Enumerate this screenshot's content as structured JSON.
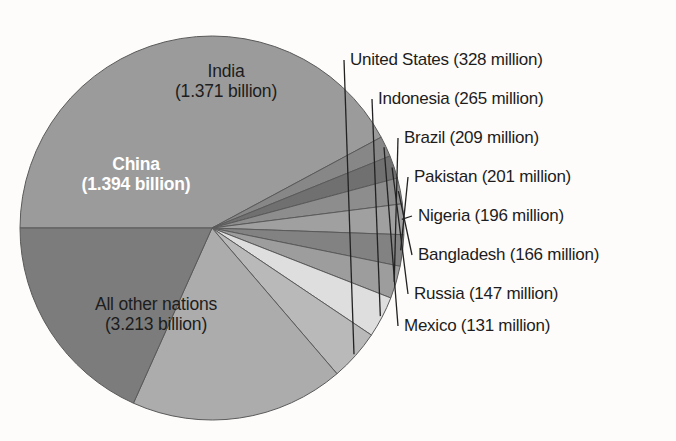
{
  "figure": {
    "background_color": "#fdfcfa",
    "text_color": "#1d1d1d",
    "inside_label_light_color": "#ffffff"
  },
  "chart_data": {
    "type": "pie",
    "title": "",
    "subtitle": "",
    "xlabel": "",
    "ylabel": "",
    "grid": false,
    "legend_position": "none",
    "units": "people",
    "total_label": "7.301 billion",
    "categories": [
      "China",
      "India",
      "United States",
      "Indonesia",
      "Brazil",
      "Pakistan",
      "Nigeria",
      "Bangladesh",
      "Russia",
      "Mexico",
      "All other nations"
    ],
    "values": [
      1394,
      1371,
      328,
      265,
      209,
      201,
      196,
      166,
      147,
      131,
      3213
    ],
    "value_unit": "million",
    "slices": [
      {
        "name": "China",
        "label_line1": "China",
        "label_line2": "(1.394 billion)",
        "value_millions": 1394,
        "display_value": "1.394 billion",
        "color": "#7b7b7b",
        "label_placement": "inside",
        "label_style": "light-bold"
      },
      {
        "name": "India",
        "label_line1": "India",
        "label_line2": "(1.371 billion)",
        "value_millions": 1371,
        "display_value": "1.371 billion",
        "color": "#acacac",
        "label_placement": "inside",
        "label_style": "dark"
      },
      {
        "name": "United States",
        "callout": "United States (328 million)",
        "value_millions": 328,
        "display_value": "328 million",
        "color": "#b9b9b9",
        "label_placement": "callout"
      },
      {
        "name": "Indonesia",
        "callout": "Indonesia (265 million)",
        "value_millions": 265,
        "display_value": "265 million",
        "color": "#dedede",
        "label_placement": "callout"
      },
      {
        "name": "Brazil",
        "callout": "Brazil (209 million)",
        "value_millions": 209,
        "display_value": "209 million",
        "color": "#9d9d9d",
        "label_placement": "callout"
      },
      {
        "name": "Pakistan",
        "callout": "Pakistan (201 million)",
        "value_millions": 201,
        "display_value": "201 million",
        "color": "#828282",
        "label_placement": "callout"
      },
      {
        "name": "Nigeria",
        "callout": "Nigeria (196 million)",
        "value_millions": 196,
        "display_value": "196 million",
        "color": "#a0a0a0",
        "label_placement": "callout"
      },
      {
        "name": "Bangladesh",
        "callout": "Bangladesh (166 million)",
        "value_millions": 166,
        "display_value": "166 million",
        "color": "#8d8d8d",
        "label_placement": "callout"
      },
      {
        "name": "Russia",
        "callout": "Russia (147 million)",
        "value_millions": 147,
        "display_value": "147 million",
        "color": "#6f6f6f",
        "label_placement": "callout"
      },
      {
        "name": "Mexico",
        "callout": "Mexico (131 million)",
        "value_millions": 131,
        "display_value": "131 million",
        "color": "#878787",
        "label_placement": "callout"
      },
      {
        "name": "All other nations",
        "label_line1": "All other nations",
        "label_line2": "(3.213 billion)",
        "value_millions": 3213,
        "display_value": "3.213 billion",
        "color": "#9b9b9b",
        "label_placement": "inside",
        "label_style": "dark"
      }
    ]
  },
  "labels": {
    "china_l1": "China",
    "china_l2": "(1.394 billion)",
    "india_l1": "India",
    "india_l2": "(1.371 billion)",
    "other_l1": "All other nations",
    "other_l2": "(3.213 billion)",
    "united_states": "United States (328 million)",
    "indonesia": "Indonesia (265 million)",
    "brazil": "Brazil (209 million)",
    "pakistan": "Pakistan (201 million)",
    "nigeria": "Nigeria (196 million)",
    "bangladesh": "Bangladesh (166 million)",
    "russia": "Russia (147 million)",
    "mexico": "Mexico (131 million)"
  }
}
